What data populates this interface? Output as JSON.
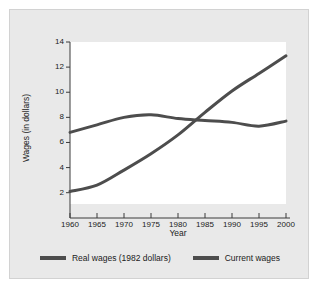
{
  "chart_data": {
    "type": "line",
    "title": "",
    "xlabel": "Year",
    "ylabel": "Wages (in dollars)",
    "xlim": [
      1960,
      2000
    ],
    "ylim": [
      1.1,
      14.0
    ],
    "xticks": [
      1960,
      1965,
      1970,
      1975,
      1980,
      1985,
      1990,
      1995,
      2000
    ],
    "yticks": [
      2,
      4,
      6,
      8,
      10,
      12,
      14
    ],
    "xtick_labels": [
      "1960",
      "1965",
      "1970",
      "1975",
      "1980",
      "1985",
      "1990",
      "1995",
      "2000"
    ],
    "ytick_labels": [
      "2",
      "4",
      "6",
      "8",
      "10",
      "12",
      "14"
    ],
    "grid": false,
    "legend_position": "bottom",
    "line_color": "#4d4d4d",
    "line_width": 3,
    "x": [
      1960,
      1965,
      1970,
      1975,
      1980,
      1985,
      1990,
      1995,
      2000
    ],
    "series": [
      {
        "name": "Real wages (1982 dollars)",
        "values": [
          2.1,
          2.6,
          3.8,
          5.1,
          6.6,
          8.4,
          10.1,
          11.5,
          12.9
        ]
      },
      {
        "name": "Current wages",
        "values": [
          6.8,
          7.4,
          8.0,
          8.2,
          7.9,
          7.75,
          7.6,
          7.3,
          7.7
        ]
      }
    ]
  },
  "legend": {
    "entries": [
      {
        "label": "Real wages (1982 dollars)",
        "color": "#4d4d4d"
      },
      {
        "label": "Current wages",
        "color": "#4d4d4d"
      }
    ]
  }
}
